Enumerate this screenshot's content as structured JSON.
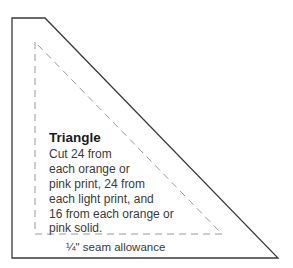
{
  "diagram": {
    "type": "quilt-template",
    "shape_name": "Triangle",
    "instructions": [
      "Cut 24 from",
      "each orange or",
      "pink print, 24 from",
      "each light print, and",
      "16 from each orange or",
      "pink solid."
    ],
    "seam_label": "¼\" seam allowance",
    "colors": {
      "outline": "#3a3a3a",
      "dashed_line": "#9a9a9a",
      "text": "#333333",
      "background": "#ffffff"
    }
  }
}
